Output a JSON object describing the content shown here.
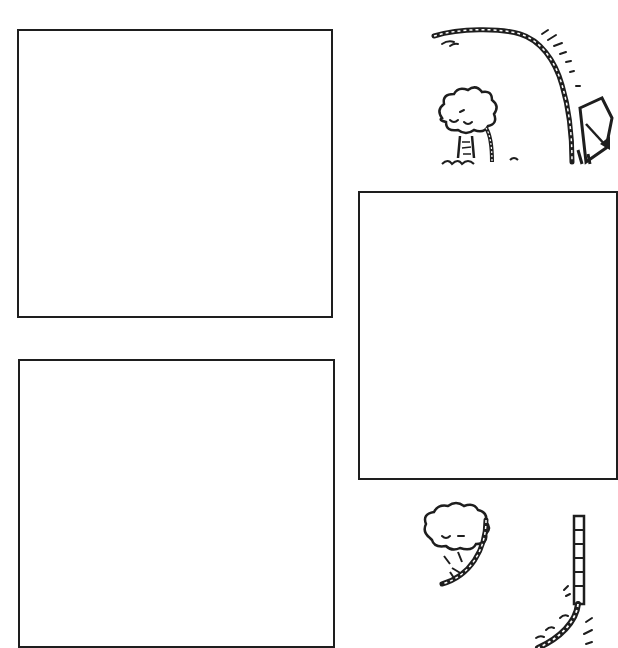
{
  "worksheet": {
    "panels": [
      {
        "id": "panel-1",
        "left": 17,
        "top": 29,
        "width": 316,
        "height": 289
      },
      {
        "id": "panel-2",
        "left": 18,
        "top": 359,
        "width": 317,
        "height": 289
      },
      {
        "id": "panel-3",
        "left": 358,
        "top": 191,
        "width": 260,
        "height": 289
      }
    ],
    "colors": {
      "stroke": "#1e1e1e",
      "background": "#ffffff"
    },
    "illustrations": [
      {
        "name": "vine-curve-top",
        "description": "rope/vine arcing from left into a downward slope with a tree"
      },
      {
        "name": "slide-cart",
        "description": "partial cart/slide at right edge"
      },
      {
        "name": "vine-curve-bottom",
        "description": "tree with rope/vine and a vertical ladder-like vine descending"
      }
    ],
    "edge_text": ""
  }
}
